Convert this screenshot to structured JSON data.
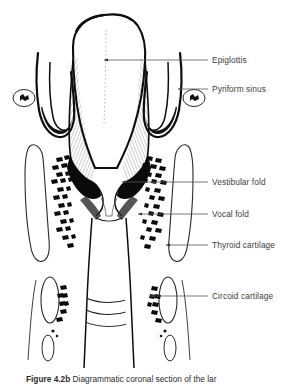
{
  "figure": {
    "title_number": "Figure 4.2b",
    "caption_text": "Diagrammatic coronal section of the lar",
    "background_color": "#ffffff",
    "ink_color": "#111111",
    "label_color": "#3d3d3d",
    "leader_color": "#555555"
  },
  "labels": [
    {
      "id": "epiglottis",
      "text": "Epiglottis",
      "text_x": 212,
      "text_y": 55,
      "leader_start_x": 104,
      "leader_end_x": 208,
      "leader_y": 60
    },
    {
      "id": "pyriform-sinus",
      "text": "Pyriform sinus",
      "text_x": 212,
      "text_y": 84,
      "leader_start_x": 178,
      "leader_end_x": 208,
      "leader_y": 89
    },
    {
      "id": "vestibular-fold",
      "text": "Vestibular fold",
      "text_x": 212,
      "text_y": 177,
      "leader_start_x": 122,
      "leader_end_x": 208,
      "leader_y": 182
    },
    {
      "id": "vocal-fold",
      "text": "Vocal fold",
      "text_x": 212,
      "text_y": 209,
      "leader_start_x": 138,
      "leader_end_x": 208,
      "leader_y": 214
    },
    {
      "id": "thyroid-cartilage",
      "text": "Thyroid cartilage",
      "text_x": 212,
      "text_y": 240,
      "leader_start_x": 166,
      "leader_end_x": 208,
      "leader_y": 245
    },
    {
      "id": "circoid-cartilage",
      "text": "Circoid cartilage",
      "text_x": 212,
      "text_y": 291,
      "leader_start_x": 150,
      "leader_end_x": 208,
      "leader_y": 296
    }
  ],
  "structures": {
    "epiglottis": "dome-shaped hatched body at top center",
    "pyriform_sinus": "hooked recess lateral to epiglottis on both sides",
    "vestibular_fold": "upper paired fold above the ventricle",
    "ventricle": "black wedge-shaped space between folds",
    "vocal_fold": "lower paired fold bounding the glottis",
    "thyroid_cartilage": "tall rounded lamina outline with stippled dashes",
    "circoid_cartilage": "small oval ring below thyroid cartilage",
    "trachea": "vertically hatched airway descending from glottis",
    "superior_cornu": "small oval ossicle lateral to pyriform sinus"
  }
}
